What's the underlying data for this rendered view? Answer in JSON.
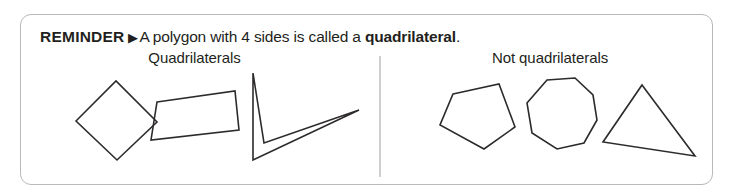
{
  "panel": {
    "border_color": "#b9b9b9",
    "background": "#ffffff"
  },
  "header": {
    "kicker": "REMINDER",
    "marker": "▶",
    "sentence_before": "A polygon with 4 sides is called a ",
    "term": "quadrilateral",
    "sentence_after": "."
  },
  "columns": [
    {
      "id": "quadrilaterals",
      "title": "Quadrilaterals",
      "shapes": [
        {
          "name": "rhombus",
          "sides": 4,
          "points": "41,48 81,8 122,49 82,87",
          "viewbox": "0 0 132 100"
        },
        {
          "name": "trapezoid",
          "sides": 4,
          "points": "28,29 106,18 110,57 22,67",
          "viewbox": "0 0 120 100"
        },
        {
          "name": "dart",
          "sides": 4,
          "points": "36,0 47,70 142,37 36,87",
          "viewbox": "0 0 152 100"
        }
      ]
    },
    {
      "id": "not-quadrilaterals",
      "title": "Not quadrilaterals",
      "shapes": [
        {
          "name": "pentagon",
          "sides": 5,
          "points": "27,21 73,11 89,54 58,76 14,52",
          "viewbox": "0 0 100 100"
        },
        {
          "name": "octagon",
          "sides": 8,
          "points": "29,7 57,5 75,22 79,47 66,70 39,76 14,60 9,30",
          "viewbox": "0 0 90 100"
        },
        {
          "name": "triangle",
          "sides": 3,
          "points": "40,12 93,83 1,69",
          "viewbox": "0 0 100 100"
        }
      ]
    }
  ],
  "divider": {
    "color": "#cfcfcf"
  }
}
